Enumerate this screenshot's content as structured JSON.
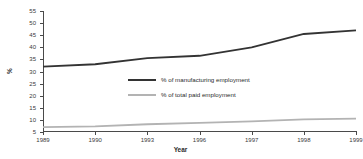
{
  "chart_data": {
    "type": "line",
    "title": "",
    "xlabel": "Year",
    "ylabel": "%",
    "categories": [
      "1989",
      "1990",
      "1993",
      "1996",
      "1997",
      "1998",
      "1999"
    ],
    "ylim": [
      5,
      55
    ],
    "ytick_step": 5,
    "yticks": [
      55,
      50,
      45,
      40,
      35,
      30,
      25,
      20,
      15,
      10,
      5
    ],
    "grid": false,
    "legend_position": "inside-center",
    "series": [
      {
        "name": "% of manufacturing employment",
        "color": "#333333",
        "values": [
          32,
          33,
          35.5,
          36.5,
          40,
          45.5,
          47
        ]
      },
      {
        "name": "% of total paid employment",
        "color": "#b3b3b3",
        "values": [
          7,
          7.3,
          8.2,
          8.8,
          9.4,
          10.2,
          10.5
        ]
      }
    ]
  }
}
